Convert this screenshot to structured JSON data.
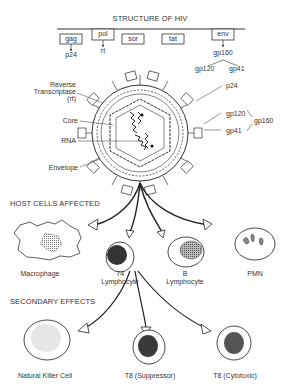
{
  "title": "STRUCTURE OF HIV",
  "genes": [
    {
      "label": "gag",
      "product": "p24"
    },
    {
      "label": "pol",
      "product": "rt"
    },
    {
      "label": "sor",
      "product": ""
    },
    {
      "label": "tat",
      "product": ""
    },
    {
      "label": "env",
      "product": "gp160"
    }
  ],
  "env_split": [
    "gp120",
    "gp41"
  ],
  "virion_labels": {
    "left": [
      "Reverse",
      "Transcriptase",
      "(rt)",
      "Core",
      "RNA",
      "Envelope"
    ],
    "right": [
      "p24",
      "gp120",
      "gp41",
      "gp160"
    ]
  },
  "sections": {
    "host": "HOST CELLS AFFECTED",
    "secondary": "SECONDARY EFFECTS"
  },
  "host_cells": [
    {
      "label": "Macrophage"
    },
    {
      "label": "T4",
      "sub": "Lymphocyte"
    },
    {
      "label": "B",
      "sub": "Lymphocyte"
    },
    {
      "label": "PMN"
    }
  ],
  "secondary_cells": [
    {
      "label": "Natural Killer Cell"
    },
    {
      "label": "T8 (Suppressor)"
    },
    {
      "label": "T8 (Cytotoxic)"
    }
  ]
}
